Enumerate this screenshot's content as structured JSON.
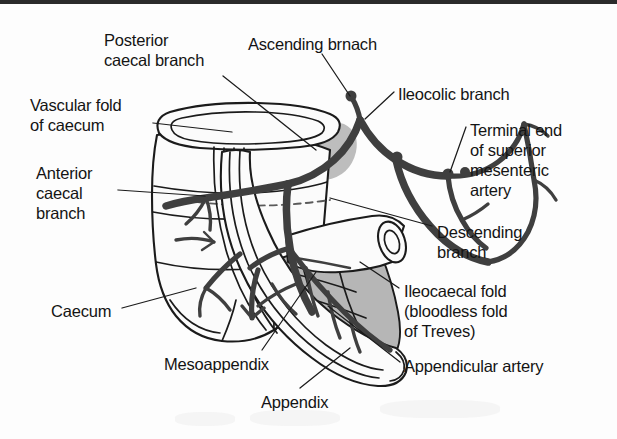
{
  "figure": {
    "border_color": "#2b2b2b",
    "background_color": "#fdfdfd",
    "ink_color": "#141414",
    "vessel_color": "#3f3f3f",
    "mesentery_shade": "#b6b6b6",
    "organ_fill": "#fbfbfb"
  },
  "labels": [
    {
      "id": "posterior-caecal-branch",
      "lines": [
        "Posterior",
        "caecal branch"
      ],
      "text": "Posterior caecal branch",
      "x": 104,
      "y": 30
    },
    {
      "id": "ascending-branch",
      "lines": [
        "Ascending brnach"
      ],
      "text": "Ascending brnach",
      "x": 248,
      "y": 34
    },
    {
      "id": "ileocolic-branch",
      "lines": [
        "Ileocolic branch"
      ],
      "text": "Ileocolic branch",
      "x": 398,
      "y": 84
    },
    {
      "id": "vascular-fold-of-caecum",
      "lines": [
        "Vascular fold",
        "of caecum"
      ],
      "text": "Vascular fold of caecum",
      "x": 30,
      "y": 95
    },
    {
      "id": "terminal-end-of-superior-mesenteric-artery",
      "lines": [
        "Terminal end",
        "of superior",
        "mesenteric",
        "artery"
      ],
      "text": "Terminal end of superior mesenteric artery",
      "x": 470,
      "y": 120
    },
    {
      "id": "anterior-caecal-branch",
      "lines": [
        "Anterior",
        "caecal",
        "branch"
      ],
      "text": "Anterior caecal branch",
      "x": 36,
      "y": 163
    },
    {
      "id": "descending-branch",
      "lines": [
        "Descending",
        "branch"
      ],
      "text": "Descending branch",
      "x": 437,
      "y": 222
    },
    {
      "id": "ileocaecal-fold",
      "lines": [
        "Ileocaecal fold",
        "(bloodless fold",
        "of Treves)"
      ],
      "text": "Ileocaecal fold (bloodless fold of Treves)",
      "x": 404,
      "y": 281
    },
    {
      "id": "caecum",
      "lines": [
        "Caecum"
      ],
      "text": "Caecum",
      "x": 51,
      "y": 301
    },
    {
      "id": "appendicular-artery",
      "lines": [
        "Appendicular artery"
      ],
      "text": "Appendicular artery",
      "x": 404,
      "y": 356
    },
    {
      "id": "mesoappendix",
      "lines": [
        "Mesoappendix"
      ],
      "text": "Mesoappendix",
      "x": 164,
      "y": 354
    },
    {
      "id": "appendix",
      "lines": [
        "Appendix"
      ],
      "text": "Appendix",
      "x": 261,
      "y": 392
    }
  ],
  "structures": [
    {
      "id": "caecum-body",
      "name": "Caecum"
    },
    {
      "id": "vascular-fold",
      "name": "Vascular fold of caecum"
    },
    {
      "id": "appendix-tube",
      "name": "Vermiform appendix"
    },
    {
      "id": "mesoappendix-sheet",
      "name": "Mesoappendix"
    },
    {
      "id": "ileum-cut-end",
      "name": "Cut end of ileum"
    },
    {
      "id": "ileocolic-artery",
      "name": "Ileocolic branch"
    },
    {
      "id": "ascending-artery",
      "name": "Ascending branch"
    },
    {
      "id": "descending-artery",
      "name": "Descending branch"
    },
    {
      "id": "anterior-caecal-artery",
      "name": "Anterior caecal branch"
    },
    {
      "id": "posterior-caecal-artery",
      "name": "Posterior caecal branch"
    },
    {
      "id": "appendicular-artery-vessel",
      "name": "Appendicular artery"
    },
    {
      "id": "superior-mesenteric-artery-end",
      "name": "Terminal end of superior mesenteric artery"
    }
  ]
}
